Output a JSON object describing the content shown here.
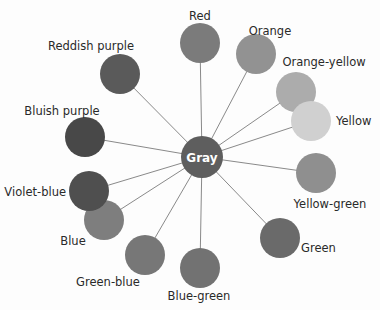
{
  "diagram": {
    "type": "color-wheel-radial",
    "center": {
      "label": "Gray",
      "x": 202,
      "y": 157,
      "r": 21,
      "color": "#5e5e5e"
    },
    "nodes": [
      {
        "label": "Red",
        "x": 200,
        "y": 43,
        "r": 20,
        "color": "#7b7b7b",
        "lx": 200,
        "ly": 20,
        "anchor": "middle"
      },
      {
        "label": "Orange",
        "x": 256,
        "y": 54,
        "r": 20,
        "color": "#929292",
        "lx": 270,
        "ly": 35,
        "anchor": "middle"
      },
      {
        "label": "Orange-yellow",
        "x": 296,
        "y": 92,
        "r": 20,
        "color": "#acacac",
        "lx": 324,
        "ly": 66,
        "anchor": "middle"
      },
      {
        "label": "Yellow",
        "x": 311,
        "y": 121,
        "r": 20,
        "color": "#d0d0d0",
        "lx": 336,
        "ly": 125,
        "anchor": "start"
      },
      {
        "label": "Yellow-green",
        "x": 316,
        "y": 173,
        "r": 20,
        "color": "#8f8f8f",
        "lx": 330,
        "ly": 208,
        "anchor": "middle"
      },
      {
        "label": "Green",
        "x": 280,
        "y": 238,
        "r": 20,
        "color": "#6a6a6a",
        "lx": 301,
        "ly": 252,
        "anchor": "start"
      },
      {
        "label": "Blue-green",
        "x": 200,
        "y": 268,
        "r": 20,
        "color": "#727272",
        "lx": 199,
        "ly": 300,
        "anchor": "middle"
      },
      {
        "label": "Green-blue",
        "x": 145,
        "y": 255,
        "r": 20,
        "color": "#777777",
        "lx": 108,
        "ly": 286,
        "anchor": "middle"
      },
      {
        "label": "Blue",
        "x": 104,
        "y": 220,
        "r": 20,
        "color": "#7e7e7e",
        "lx": 73,
        "ly": 245,
        "anchor": "middle"
      },
      {
        "label": "Violet-blue",
        "x": 89,
        "y": 191,
        "r": 20,
        "color": "#4f4f4f",
        "lx": 66,
        "ly": 196,
        "anchor": "end"
      },
      {
        "label": "Bluish purple",
        "x": 85,
        "y": 137,
        "r": 20,
        "color": "#484848",
        "lx": 62,
        "ly": 115,
        "anchor": "middle"
      },
      {
        "label": "Reddish purple",
        "x": 120,
        "y": 74,
        "r": 20,
        "color": "#5a5a5a",
        "lx": 91,
        "ly": 50,
        "anchor": "middle"
      }
    ]
  }
}
